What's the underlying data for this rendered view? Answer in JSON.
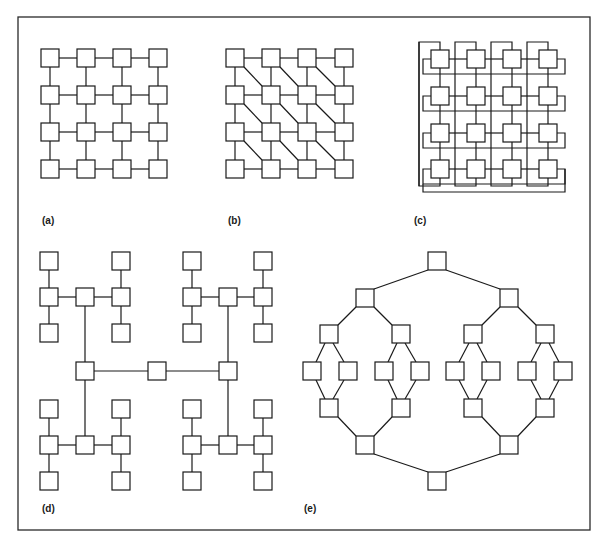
{
  "figure": {
    "frame": {
      "x": 18,
      "y": 17,
      "width": 572,
      "height": 513
    },
    "colors": {
      "stroke": "#1a1a1a",
      "node_fill": "#ffffff",
      "background": "#ffffff"
    },
    "node_size": 18,
    "panels": [
      {
        "id": "a",
        "label": "(a)",
        "label_pos": [
          42,
          224
        ],
        "topology": "2D mesh 4x4",
        "cols_x": [
          41,
          77,
          113,
          149
        ],
        "rows_y": [
          49,
          86,
          123,
          160
        ]
      },
      {
        "id": "b",
        "label": "(b)",
        "label_pos": [
          228,
          224
        ],
        "topology": "2D mesh 4x4 with diagonal links",
        "cols_x": [
          226,
          262,
          298,
          335
        ],
        "rows_y": [
          49,
          86,
          123,
          160
        ]
      },
      {
        "id": "c",
        "label": "(c)",
        "label_pos": [
          414,
          224
        ],
        "topology": "2D torus 4x4 (wraparound)",
        "cols_x": [
          431,
          467,
          503,
          539
        ],
        "rows_y": [
          50,
          87,
          124,
          160
        ]
      },
      {
        "id": "d",
        "label": "(d)",
        "label_pos": [
          42,
          512
        ],
        "topology": "H-tree",
        "nodes": [
          [
            40,
            252
          ],
          [
            112,
            252
          ],
          [
            40,
            288
          ],
          [
            76,
            288
          ],
          [
            112,
            288
          ],
          [
            40,
            324
          ],
          [
            112,
            324
          ],
          [
            183,
            252
          ],
          [
            254,
            252
          ],
          [
            183,
            288
          ],
          [
            219,
            288
          ],
          [
            254,
            288
          ],
          [
            183,
            324
          ],
          [
            254,
            324
          ],
          [
            76,
            362
          ],
          [
            148,
            362
          ],
          [
            219,
            362
          ],
          [
            40,
            400
          ],
          [
            112,
            400
          ],
          [
            40,
            436
          ],
          [
            76,
            436
          ],
          [
            112,
            436
          ],
          [
            40,
            472
          ],
          [
            112,
            472
          ],
          [
            183,
            400
          ],
          [
            254,
            400
          ],
          [
            183,
            436
          ],
          [
            219,
            436
          ],
          [
            254,
            436
          ],
          [
            183,
            472
          ],
          [
            254,
            472
          ]
        ],
        "edges": [
          [
            0,
            2
          ],
          [
            2,
            5
          ],
          [
            2,
            3
          ],
          [
            3,
            4
          ],
          [
            1,
            4
          ],
          [
            4,
            6
          ],
          [
            7,
            9
          ],
          [
            9,
            12
          ],
          [
            9,
            10
          ],
          [
            10,
            11
          ],
          [
            8,
            11
          ],
          [
            11,
            13
          ],
          [
            14,
            15
          ],
          [
            15,
            16
          ],
          [
            3,
            14
          ],
          [
            10,
            16
          ],
          [
            17,
            19
          ],
          [
            19,
            22
          ],
          [
            19,
            20
          ],
          [
            20,
            21
          ],
          [
            18,
            21
          ],
          [
            21,
            23
          ],
          [
            24,
            26
          ],
          [
            26,
            29
          ],
          [
            26,
            27
          ],
          [
            27,
            28
          ],
          [
            25,
            28
          ],
          [
            28,
            30
          ],
          [
            14,
            20
          ],
          [
            16,
            27
          ]
        ]
      },
      {
        "id": "e",
        "label": "(e)",
        "label_pos": [
          304,
          512
        ],
        "topology": "Butterfly-like double binary tree",
        "nodes": [
          [
            428,
            252
          ],
          [
            356,
            289
          ],
          [
            500,
            289
          ],
          [
            320,
            325
          ],
          [
            392,
            325
          ],
          [
            464,
            325
          ],
          [
            536,
            325
          ],
          [
            303,
            362
          ],
          [
            339,
            362
          ],
          [
            375,
            362
          ],
          [
            411,
            362
          ],
          [
            446,
            362
          ],
          [
            482,
            362
          ],
          [
            518,
            362
          ],
          [
            554,
            362
          ],
          [
            320,
            399
          ],
          [
            392,
            399
          ],
          [
            464,
            399
          ],
          [
            536,
            399
          ],
          [
            356,
            436
          ],
          [
            500,
            436
          ],
          [
            428,
            472
          ]
        ],
        "edges": [
          [
            0,
            1
          ],
          [
            0,
            2
          ],
          [
            1,
            3
          ],
          [
            1,
            4
          ],
          [
            2,
            5
          ],
          [
            2,
            6
          ],
          [
            3,
            7
          ],
          [
            3,
            8
          ],
          [
            4,
            9
          ],
          [
            4,
            10
          ],
          [
            5,
            11
          ],
          [
            5,
            12
          ],
          [
            6,
            13
          ],
          [
            6,
            14
          ],
          [
            7,
            15
          ],
          [
            8,
            15
          ],
          [
            9,
            16
          ],
          [
            10,
            16
          ],
          [
            11,
            17
          ],
          [
            12,
            17
          ],
          [
            13,
            18
          ],
          [
            14,
            18
          ],
          [
            15,
            19
          ],
          [
            16,
            19
          ],
          [
            17,
            20
          ],
          [
            18,
            20
          ],
          [
            19,
            21
          ],
          [
            20,
            21
          ]
        ]
      }
    ]
  }
}
